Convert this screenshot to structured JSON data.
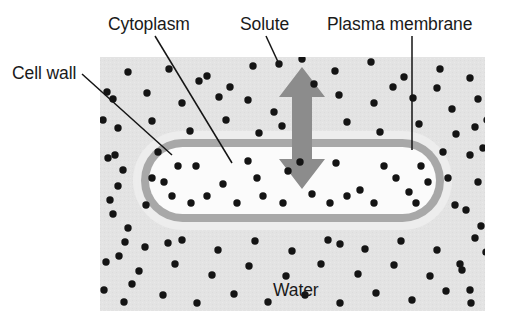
{
  "diagram": {
    "type": "biology-cell-cross-section",
    "canvas": {
      "width": 506,
      "height": 324
    },
    "colors": {
      "page_background": "#ffffff",
      "solution_background": "#e3e3e3",
      "cell_wall": "#ededed",
      "plasma_membrane": "#a8a8a8",
      "cytoplasm": "#fbfbfb",
      "solute_dot": "#141414",
      "arrow": "#8c8c8c",
      "leader_line": "#151515",
      "label_text": "#1a1a1a"
    },
    "labels": [
      {
        "id": "cytoplasm",
        "text": "Cytoplasm",
        "text_x": 108,
        "text_y": 30,
        "leader": "M155,36 L232,163"
      },
      {
        "id": "solute",
        "text": "Solute",
        "text_x": 240,
        "text_y": 30,
        "leader": "M266,36 L279,64"
      },
      {
        "id": "plasma-membrane",
        "text": "Plasma membrane",
        "text_x": 327,
        "text_y": 30,
        "leader": "M412,36 L412,150"
      },
      {
        "id": "cell-wall",
        "text": "Cell wall",
        "text_x": 12,
        "text_y": 79,
        "leader": "M82,74 L172,155"
      },
      {
        "id": "water",
        "text": "Water",
        "text_x": 273,
        "text_y": 296,
        "leader": ""
      }
    ],
    "solution_region": {
      "x": 100,
      "y": 57,
      "width": 385,
      "height": 254
    },
    "cell": {
      "wall_outer": {
        "x": 133,
        "y": 131,
        "width": 319,
        "height": 99,
        "radius": 49.5
      },
      "membrane": {
        "x": 141,
        "y": 139,
        "width": 303,
        "height": 83,
        "radius": 41.5
      },
      "cytoplasm": {
        "x": 149,
        "y": 147,
        "width": 287,
        "height": 67,
        "radius": 33.5
      }
    },
    "water_arrow": {
      "id": "double-headed-vertical-arrow",
      "x_center": 302,
      "top_y": 67,
      "bottom_y": 189,
      "shaft_half_width": 10,
      "head_half_width": 23,
      "head_height": 30,
      "direction": "bidirectional"
    },
    "solute_dots_outside": [
      [
        128,
        72
      ],
      [
        169,
        69
      ],
      [
        207,
        76
      ],
      [
        253,
        66
      ],
      [
        279,
        64
      ],
      [
        302,
        59
      ],
      [
        335,
        71
      ],
      [
        371,
        62
      ],
      [
        404,
        77
      ],
      [
        440,
        69
      ],
      [
        470,
        78
      ],
      [
        113,
        99
      ],
      [
        147,
        93
      ],
      [
        182,
        103
      ],
      [
        219,
        97
      ],
      [
        248,
        100
      ],
      [
        274,
        112
      ],
      [
        339,
        95
      ],
      [
        374,
        103
      ],
      [
        413,
        98
      ],
      [
        452,
        109
      ],
      [
        478,
        99
      ],
      [
        118,
        128
      ],
      [
        152,
        121
      ],
      [
        190,
        131
      ],
      [
        226,
        120
      ],
      [
        259,
        133
      ],
      [
        282,
        126
      ],
      [
        347,
        122
      ],
      [
        380,
        132
      ],
      [
        419,
        124
      ],
      [
        456,
        134
      ],
      [
        475,
        127
      ],
      [
        108,
        158
      ],
      [
        118,
        186
      ],
      [
        113,
        214
      ],
      [
        125,
        242
      ],
      [
        106,
        262
      ],
      [
        132,
        284
      ],
      [
        470,
        155
      ],
      [
        478,
        182
      ],
      [
        466,
        210
      ],
      [
        475,
        238
      ],
      [
        460,
        264
      ],
      [
        470,
        290
      ],
      [
        107,
        92
      ],
      [
        103,
        120
      ],
      [
        115,
        155
      ],
      [
        123,
        170
      ],
      [
        110,
        200
      ],
      [
        128,
        228
      ],
      [
        119,
        256
      ],
      [
        104,
        290
      ],
      [
        487,
        120
      ],
      [
        483,
        148
      ],
      [
        490,
        198
      ],
      [
        481,
        226
      ],
      [
        486,
        252
      ],
      [
        124,
        302
      ],
      [
        163,
        295
      ],
      [
        197,
        303
      ],
      [
        234,
        294
      ],
      [
        268,
        302
      ],
      [
        305,
        295
      ],
      [
        340,
        303
      ],
      [
        376,
        293
      ],
      [
        412,
        300
      ],
      [
        446,
        291
      ],
      [
        471,
        303
      ],
      [
        139,
        271
      ],
      [
        175,
        264
      ],
      [
        212,
        275
      ],
      [
        249,
        266
      ],
      [
        286,
        276
      ],
      [
        321,
        264
      ],
      [
        358,
        274
      ],
      [
        394,
        265
      ],
      [
        430,
        276
      ],
      [
        462,
        270
      ],
      [
        145,
        247
      ],
      [
        182,
        240
      ],
      [
        218,
        250
      ],
      [
        255,
        241
      ],
      [
        292,
        251
      ],
      [
        328,
        240
      ],
      [
        365,
        249
      ],
      [
        401,
        241
      ],
      [
        437,
        250
      ],
      [
        146,
        205
      ],
      [
        455,
        205
      ],
      [
        152,
        178
      ],
      [
        448,
        178
      ],
      [
        158,
        152
      ],
      [
        443,
        152
      ],
      [
        168,
        243
      ],
      [
        340,
        244
      ],
      [
        199,
        81
      ],
      [
        230,
        87
      ],
      [
        314,
        84
      ],
      [
        393,
        87
      ],
      [
        437,
        88
      ]
    ],
    "solute_dots_inside": [
      [
        172,
        196
      ],
      [
        196,
        166
      ],
      [
        223,
        184
      ],
      [
        248,
        161
      ],
      [
        263,
        196
      ],
      [
        288,
        171
      ],
      [
        312,
        194
      ],
      [
        336,
        163
      ],
      [
        360,
        190
      ],
      [
        384,
        166
      ],
      [
        409,
        192
      ],
      [
        421,
        166
      ],
      [
        191,
        203
      ],
      [
        237,
        203
      ],
      [
        283,
        203
      ],
      [
        330,
        203
      ],
      [
        374,
        203
      ],
      [
        416,
        203
      ],
      [
        178,
        166
      ],
      [
        207,
        196
      ],
      [
        257,
        178
      ],
      [
        300,
        162
      ],
      [
        347,
        196
      ],
      [
        396,
        178
      ],
      [
        164,
        182
      ],
      [
        428,
        182
      ]
    ]
  }
}
